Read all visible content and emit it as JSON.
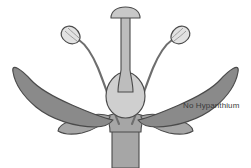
{
  "figure": {
    "background_color": "#ffffff",
    "width": 251,
    "height": 168
  },
  "annotations": [
    {
      "id": "no-hypanthium",
      "text": "No Hypanthium",
      "color": "#3b3b3b",
      "x": 183,
      "y": 101
    }
  ],
  "colors": {
    "petal_fill": "#8a8a8a",
    "sepal_fill": "#a6a6a6",
    "receptacle_fill": "#a6a6a6",
    "pedicel_fill": "#a6a6a6",
    "ovary_fill": "#cfcfcf",
    "style_fill": "#bdbdbd",
    "stigma_fill": "#c8c8c8",
    "anther_fill": "#e2e2e2",
    "filament_stroke": "#6e6e6e",
    "outline": "#4a4a4a",
    "background": "#ffffff",
    "label_text": "#3b3b3b"
  },
  "parts": {
    "stigma": "stigma",
    "style": "style",
    "ovary": "ovary",
    "pistil": "pistil",
    "anther_left": "anther-left",
    "anther_right": "anther-right",
    "filament_left": "filament-left",
    "filament_right": "filament-right",
    "petal_left": "petal-left",
    "petal_right": "petal-right",
    "sepal_left": "sepal-left",
    "sepal_right": "sepal-right",
    "sepal_inner_left": "sepal-inner-left",
    "sepal_inner_right": "sepal-inner-right",
    "receptacle": "receptacle",
    "pedicel": "pedicel"
  }
}
